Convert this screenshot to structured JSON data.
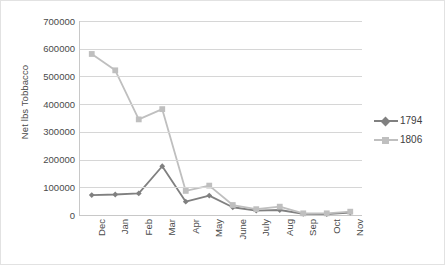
{
  "chart_data": {
    "type": "line",
    "title": "",
    "xlabel": "",
    "ylabel": "Net lbs Tobbacco",
    "categories": [
      "Dec",
      "Jan",
      "Feb",
      "Mar",
      "Apr",
      "May",
      "June",
      "July",
      "Aug",
      "Sep",
      "Oct",
      "Nov"
    ],
    "ylim": [
      0,
      700000
    ],
    "ytick_labels": [
      "0",
      "100000",
      "200000",
      "300000",
      "400000",
      "500000",
      "600000",
      "700000"
    ],
    "ytick_values": [
      0,
      100000,
      200000,
      300000,
      400000,
      500000,
      600000,
      700000
    ],
    "grid": true,
    "legend_position": "right",
    "series": [
      {
        "name": "1794",
        "color": "#808080",
        "marker": "diamond",
        "values": [
          72000,
          74000,
          78000,
          176000,
          48000,
          70000,
          28000,
          16000,
          18000,
          4000,
          3000,
          9000
        ]
      },
      {
        "name": "1806",
        "color": "#bfbfbf",
        "marker": "square",
        "values": [
          581000,
          522000,
          345000,
          382000,
          87000,
          106000,
          36000,
          21000,
          30000,
          6000,
          6000,
          12000
        ]
      }
    ]
  },
  "legend": {
    "items": [
      {
        "label": "1794"
      },
      {
        "label": "1806"
      }
    ]
  },
  "colors": {
    "series_1794": "#808080",
    "series_1806": "#bfbfbf",
    "gridline": "#d6d6d6",
    "axis": "#c8c8c8",
    "text": "#4a4a4a",
    "background": "#ffffff",
    "outer_border": "#e2e2e2"
  }
}
